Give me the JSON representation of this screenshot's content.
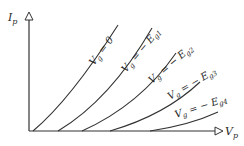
{
  "diagram": {
    "y_axis": {
      "label": "I",
      "subscript": "p"
    },
    "x_axis": {
      "label": "V",
      "subscript": "p"
    },
    "curves": [
      {
        "label_prefix": "V",
        "label_sub": "g",
        "label_rest": " = 0"
      },
      {
        "label_prefix": "V",
        "label_sub": "g",
        "label_rest": " = − E",
        "label_sub2": "g1"
      },
      {
        "label_prefix": "V",
        "label_sub": "g",
        "label_rest": " = − E",
        "label_sub2": "g2"
      },
      {
        "label_prefix": "V",
        "label_sub": "g",
        "label_rest": " = − E",
        "label_sub2": "g3"
      },
      {
        "label_prefix": "V",
        "label_sub": "g",
        "label_rest": " = − E",
        "label_sub2": "g4"
      }
    ],
    "colors": {
      "line": "#333333",
      "background": "#ffffff"
    }
  }
}
